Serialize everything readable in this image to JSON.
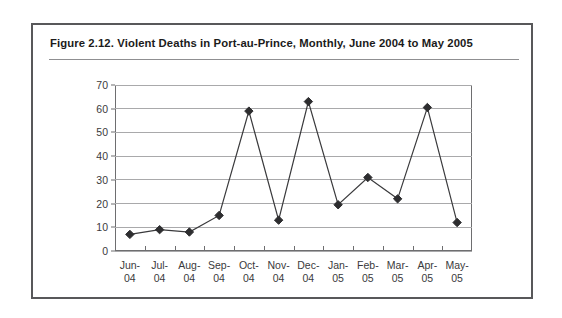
{
  "figure": {
    "title": "Figure 2.12.  Violent Deaths in Port-au-Prince, Monthly, June 2004 to May 2005",
    "frame_color": "#58585a",
    "rule_color": "#8f8f91"
  },
  "chart_data": {
    "type": "line",
    "title": "Figure 2.12.  Violent Deaths in Port-au-Prince, Monthly, June 2004 to May 2005",
    "xlabel": "",
    "ylabel": "",
    "categories": [
      "Jun-\n04",
      "Jul-\n04",
      "Aug-\n04",
      "Sep-\n04",
      "Oct-\n04",
      "Nov-\n04",
      "Dec-\n04",
      "Jan-\n05",
      "Feb-\n05",
      "Mar-\n05",
      "Apr-\n05",
      "May-\n05"
    ],
    "values": [
      7,
      9,
      8,
      15,
      59,
      13,
      63,
      19.5,
      31,
      22,
      60.5,
      12
    ],
    "ylim": [
      0,
      70
    ],
    "yticks": [
      0,
      10,
      20,
      30,
      40,
      50,
      60,
      70
    ],
    "grid": true,
    "legend": false,
    "line_color": "#3a3a3c",
    "marker": "diamond",
    "marker_color": "#2d2d2f"
  }
}
